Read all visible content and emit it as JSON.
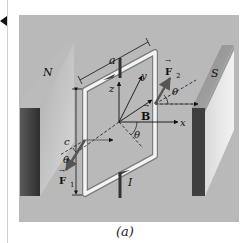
{
  "figure": {
    "caption": "(a)",
    "labels": {
      "north_pole": "N",
      "south_pole": "S",
      "side_a": "a",
      "side_c": "c",
      "axis_x": "x",
      "axis_y": "y",
      "axis_z": "z",
      "field": "B",
      "force_1": "F",
      "force_1_sub": "1",
      "force_2": "F",
      "force_2_sub": "2",
      "angle_1": "θ",
      "angle_2": "θ",
      "angle_3": "θ",
      "current": "I"
    },
    "colors": {
      "panel": "#b9b9b9",
      "magnet_dark": "#4a4a4a",
      "magnet_light": "#e6e6e6",
      "wire": "#f2f2f2",
      "ink": "#111111"
    }
  },
  "page": {
    "back_marker_icon": "triangle-left"
  }
}
